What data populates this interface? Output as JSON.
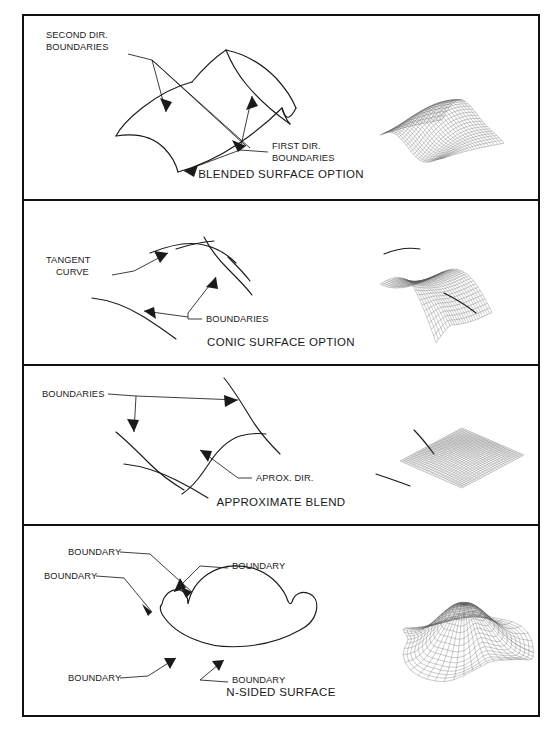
{
  "figure": {
    "name": "surface-construction-options-figure",
    "panels": [
      {
        "id": "blended-surface",
        "caption": "BLENDED SURFACE OPTION",
        "labels": [
          {
            "id": "second-dir-boundaries",
            "line1": "SECOND DIR.",
            "line2": "BOUNDARIES"
          },
          {
            "id": "first-dir-boundaries",
            "line1": "FIRST DIR.",
            "line2": "BOUNDARIES"
          }
        ],
        "wireframe": "blended-patch-wireframe"
      },
      {
        "id": "conic-surface",
        "caption": "CONIC SURFACE OPTION",
        "labels": [
          {
            "id": "tangent-curve",
            "line1": "TANGENT",
            "line2": "CURVE"
          },
          {
            "id": "boundaries",
            "line1": "BOUNDARIES",
            "line2": ""
          }
        ],
        "wireframe": "conic-patch-wireframe"
      },
      {
        "id": "approximate-blend",
        "caption": "APPROXIMATE BLEND",
        "labels": [
          {
            "id": "boundaries",
            "line1": "BOUNDARIES",
            "line2": ""
          },
          {
            "id": "aprox-dir",
            "line1": "APROX. DIR.",
            "line2": ""
          }
        ],
        "wireframe": "approximate-blend-wireframe"
      },
      {
        "id": "n-sided-surface",
        "caption": "N-SIDED SURFACE",
        "labels": [
          {
            "id": "boundary-top",
            "line1": "BOUNDARY",
            "line2": ""
          },
          {
            "id": "boundary-upper-right",
            "line1": "BOUNDARY",
            "line2": ""
          },
          {
            "id": "boundary-left",
            "line1": "BOUNDARY",
            "line2": ""
          },
          {
            "id": "boundary-bottom-left",
            "line1": "BOUNDARY",
            "line2": ""
          },
          {
            "id": "boundary-bottom-right",
            "line1": "BOUNDARY",
            "line2": ""
          }
        ],
        "wireframe": "n-sided-dome-wireframe"
      }
    ],
    "colors": {
      "frame": "#111111",
      "line_art": "#1a1a1a",
      "mesh": "#5a5a5a",
      "background": "#ffffff"
    }
  }
}
